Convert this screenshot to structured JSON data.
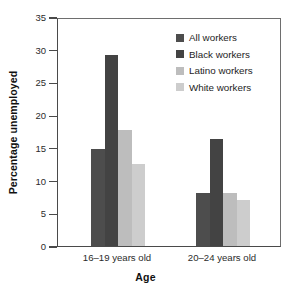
{
  "chart_data": {
    "type": "bar",
    "title": "",
    "subtitle": "",
    "xlabel": "Age",
    "ylabel": "Percentage unemployed",
    "categories": [
      "16–19 years old",
      "20–24 years old"
    ],
    "series": [
      {
        "name": "All workers",
        "values": [
          14.8,
          8.1
        ],
        "color": "#4d4d4d"
      },
      {
        "name": "Black workers",
        "values": [
          29.2,
          16.4
        ],
        "color": "#434343"
      },
      {
        "name": "Latino workers",
        "values": [
          17.7,
          8.1
        ],
        "color": "#bdbdbd"
      },
      {
        "name": "White workers",
        "values": [
          12.6,
          7.0
        ],
        "color": "#cdcdcd"
      }
    ],
    "ylim": [
      0,
      35
    ],
    "ytick_values": [
      0,
      5,
      10,
      15,
      20,
      25,
      30,
      35
    ],
    "ytick_labels": [
      "0",
      "5",
      "10",
      "15",
      "20",
      "25",
      "30",
      "35"
    ],
    "grid": false,
    "legend_position": "top-right-inside",
    "legend_entries": [
      "All workers",
      "Black workers",
      "Latino workers",
      "White workers"
    ]
  },
  "axes": {
    "y_title": "Percentage unemployed",
    "x_title": "Age"
  }
}
